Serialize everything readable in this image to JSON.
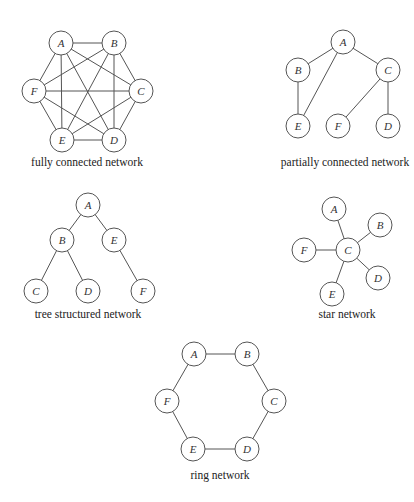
{
  "diagrams": [
    {
      "id": "fully",
      "caption": "fully connected network",
      "caption_pos": [
        87,
        166
      ],
      "nodes": [
        {
          "label": "A",
          "x": 61,
          "y": 43
        },
        {
          "label": "B",
          "x": 114,
          "y": 43
        },
        {
          "label": "C",
          "x": 141,
          "y": 91
        },
        {
          "label": "D",
          "x": 114,
          "y": 140
        },
        {
          "label": "E",
          "x": 62,
          "y": 140
        },
        {
          "label": "F",
          "x": 34,
          "y": 91
        }
      ],
      "edges": [
        [
          "A",
          "B"
        ],
        [
          "A",
          "C"
        ],
        [
          "A",
          "D"
        ],
        [
          "A",
          "E"
        ],
        [
          "A",
          "F"
        ],
        [
          "B",
          "C"
        ],
        [
          "B",
          "D"
        ],
        [
          "B",
          "E"
        ],
        [
          "B",
          "F"
        ],
        [
          "C",
          "D"
        ],
        [
          "C",
          "E"
        ],
        [
          "C",
          "F"
        ],
        [
          "D",
          "E"
        ],
        [
          "D",
          "F"
        ],
        [
          "E",
          "F"
        ]
      ]
    },
    {
      "id": "partial",
      "caption": "partially connected network",
      "caption_pos": [
        345,
        166
      ],
      "nodes": [
        {
          "label": "A",
          "x": 343,
          "y": 42
        },
        {
          "label": "B",
          "x": 298,
          "y": 70
        },
        {
          "label": "C",
          "x": 388,
          "y": 70
        },
        {
          "label": "E",
          "x": 298,
          "y": 126
        },
        {
          "label": "F",
          "x": 338,
          "y": 126
        },
        {
          "label": "D",
          "x": 388,
          "y": 126
        }
      ],
      "edges": [
        [
          "A",
          "B"
        ],
        [
          "A",
          "C"
        ],
        [
          "A",
          "E"
        ],
        [
          "B",
          "E"
        ],
        [
          "C",
          "F"
        ],
        [
          "C",
          "D"
        ]
      ]
    },
    {
      "id": "tree",
      "caption": "tree structured network",
      "caption_pos": [
        88,
        318
      ],
      "nodes": [
        {
          "label": "A",
          "x": 88,
          "y": 205
        },
        {
          "label": "B",
          "x": 62,
          "y": 240
        },
        {
          "label": "E",
          "x": 114,
          "y": 240
        },
        {
          "label": "C",
          "x": 36,
          "y": 291
        },
        {
          "label": "D",
          "x": 88,
          "y": 291
        },
        {
          "label": "F",
          "x": 143,
          "y": 291
        }
      ],
      "edges": [
        [
          "A",
          "B"
        ],
        [
          "A",
          "E"
        ],
        [
          "B",
          "C"
        ],
        [
          "B",
          "D"
        ],
        [
          "E",
          "F"
        ]
      ]
    },
    {
      "id": "star",
      "caption": "star network",
      "caption_pos": [
        347,
        318
      ],
      "nodes": [
        {
          "label": "A",
          "x": 334,
          "y": 209
        },
        {
          "label": "B",
          "x": 380,
          "y": 225
        },
        {
          "label": "C",
          "x": 348,
          "y": 250
        },
        {
          "label": "F",
          "x": 304,
          "y": 250
        },
        {
          "label": "D",
          "x": 378,
          "y": 278
        },
        {
          "label": "E",
          "x": 332,
          "y": 294
        }
      ],
      "edges": [
        [
          "C",
          "A"
        ],
        [
          "C",
          "B"
        ],
        [
          "C",
          "F"
        ],
        [
          "C",
          "D"
        ],
        [
          "C",
          "E"
        ]
      ]
    },
    {
      "id": "ring",
      "caption": "ring network",
      "caption_pos": [
        220,
        479
      ],
      "nodes": [
        {
          "label": "A",
          "x": 194,
          "y": 354
        },
        {
          "label": "B",
          "x": 247,
          "y": 354
        },
        {
          "label": "C",
          "x": 274,
          "y": 401
        },
        {
          "label": "D",
          "x": 247,
          "y": 449
        },
        {
          "label": "E",
          "x": 193,
          "y": 449
        },
        {
          "label": "F",
          "x": 167,
          "y": 401
        }
      ],
      "edges": [
        [
          "A",
          "B"
        ],
        [
          "B",
          "C"
        ],
        [
          "C",
          "D"
        ],
        [
          "D",
          "E"
        ],
        [
          "E",
          "F"
        ],
        [
          "F",
          "A"
        ]
      ]
    }
  ],
  "node_radius": 12,
  "stroke_color": "#555555"
}
